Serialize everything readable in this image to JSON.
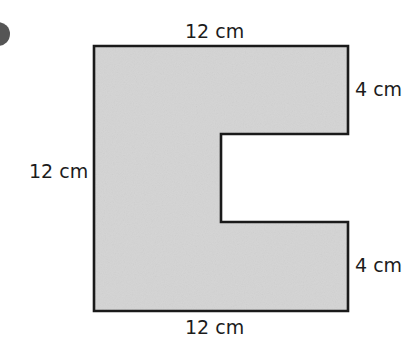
{
  "diagram": {
    "type": "compound-shape",
    "fill_color": "#d4d4d4",
    "stroke_color": "#1a1a1a",
    "labels": {
      "top": "12 cm",
      "left": "12 cm",
      "bottom": "12 cm",
      "right_top": "4 cm",
      "right_bottom": "4 cm"
    },
    "dimensions_cm": {
      "outer_width": 12,
      "outer_height": 12,
      "top_arm_height": 4,
      "bottom_arm_height": 4
    }
  }
}
